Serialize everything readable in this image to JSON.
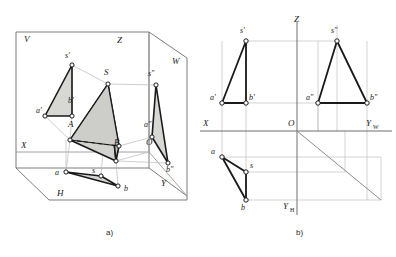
{
  "figure": {
    "captions": {
      "left": "a)",
      "right": "b)"
    },
    "colors": {
      "ink": "#1a1a1a",
      "thin_line": "#9a9a9a",
      "projection_line": "#b4b4b4",
      "face_fill": "#d6d6d2",
      "face_fill_dark": "#c7c7c2",
      "vertex_fill": "#ffffff",
      "background": "#ffffff"
    }
  },
  "panel_a": {
    "name": "pictorial-trihedral-view",
    "plane_labels": [
      {
        "id": "V",
        "text": "V",
        "x": 24,
        "y": 42
      },
      {
        "id": "Z",
        "text": "Z",
        "x": 117,
        "y": 43
      },
      {
        "id": "W",
        "text": "W",
        "x": 172,
        "y": 64
      },
      {
        "id": "X",
        "text": "X",
        "x": 21,
        "y": 148
      },
      {
        "id": "O",
        "text": "O",
        "x": 146,
        "y": 145
      },
      {
        "id": "Y",
        "text": "Y",
        "x": 161,
        "y": 186
      },
      {
        "id": "H",
        "text": "H",
        "x": 57,
        "y": 196
      }
    ],
    "point_labels": [
      {
        "id": "s-prime",
        "text": "s'",
        "x": 65,
        "y": 58
      },
      {
        "id": "S",
        "text": "S",
        "x": 104,
        "y": 75
      },
      {
        "id": "s-dblprime",
        "text": "s\"",
        "x": 148,
        "y": 76
      },
      {
        "id": "a-prime",
        "text": "a'",
        "x": 38,
        "y": 113
      },
      {
        "id": "b-prime",
        "text": "b'",
        "x": 71,
        "y": 103
      },
      {
        "id": "A",
        "text": "A",
        "x": 70,
        "y": 125
      },
      {
        "id": "B",
        "text": "B",
        "x": 116,
        "y": 143
      },
      {
        "id": "a-dblprime",
        "text": "a\"",
        "x": 146,
        "y": 127
      },
      {
        "id": "b-dblprime",
        "text": "b\"",
        "x": 169,
        "y": 158
      },
      {
        "id": "a",
        "text": "a",
        "x": 55,
        "y": 175
      },
      {
        "id": "s",
        "text": "s",
        "x": 92,
        "y": 173
      },
      {
        "id": "b",
        "text": "b",
        "x": 124,
        "y": 193
      }
    ],
    "vertices": [
      {
        "id": "s-prime",
        "x": 72,
        "y": 65
      },
      {
        "id": "S",
        "x": 108,
        "y": 84
      },
      {
        "id": "s-dblprime",
        "x": 156,
        "y": 85
      },
      {
        "id": "a-prime",
        "x": 45,
        "y": 116
      },
      {
        "id": "b-prime",
        "x": 72,
        "y": 116
      },
      {
        "id": "A",
        "x": 70,
        "y": 140
      },
      {
        "id": "B",
        "x": 119,
        "y": 146
      },
      {
        "id": "B-base",
        "x": 116,
        "y": 161
      },
      {
        "id": "a-dblprime",
        "x": 152,
        "y": 137
      },
      {
        "id": "b-dblprime",
        "x": 168,
        "y": 163
      },
      {
        "id": "a",
        "x": 66,
        "y": 172
      },
      {
        "id": "s",
        "x": 101,
        "y": 176
      },
      {
        "id": "b",
        "x": 118,
        "y": 186
      }
    ]
  },
  "panel_b": {
    "name": "epure-two-projection-drawing",
    "axis_labels": [
      {
        "id": "Z",
        "text": "Z",
        "x": 294,
        "y": 22
      },
      {
        "id": "X",
        "text": "X",
        "x": 206,
        "y": 122
      },
      {
        "id": "O",
        "text": "O",
        "x": 290,
        "y": 122
      },
      {
        "id": "Yw",
        "text": "Y",
        "sub": "W",
        "x": 368,
        "y": 122
      },
      {
        "id": "Yh",
        "text": "Y",
        "sub": "H",
        "x": 288,
        "y": 209
      }
    ],
    "point_labels": [
      {
        "id": "s-prime",
        "text": "s'",
        "x": 240,
        "y": 32
      },
      {
        "id": "s-dblprime",
        "text": "s\"",
        "x": 331,
        "y": 32
      },
      {
        "id": "a-prime",
        "text": "a'",
        "x": 212,
        "y": 98
      },
      {
        "id": "b-prime",
        "text": "b'",
        "x": 250,
        "y": 98
      },
      {
        "id": "a-dblprime",
        "text": "a\"",
        "x": 310,
        "y": 98
      },
      {
        "id": "b-dblprime",
        "text": "b\"",
        "x": 372,
        "y": 98
      },
      {
        "id": "a",
        "text": "a",
        "x": 212,
        "y": 152
      },
      {
        "id": "s",
        "text": "s",
        "x": 252,
        "y": 165
      },
      {
        "id": "b",
        "text": "b",
        "x": 240,
        "y": 208
      }
    ],
    "vertices": [
      {
        "id": "s-prime",
        "x": 246,
        "y": 41
      },
      {
        "id": "s-dblprime",
        "x": 337,
        "y": 41
      },
      {
        "id": "a-prime",
        "x": 222,
        "y": 103
      },
      {
        "id": "b-prime",
        "x": 246,
        "y": 103
      },
      {
        "id": "a-dblprime",
        "x": 318,
        "y": 103
      },
      {
        "id": "b-dblprime",
        "x": 367,
        "y": 103
      },
      {
        "id": "a",
        "x": 222,
        "y": 157
      },
      {
        "id": "s",
        "x": 246,
        "y": 172
      },
      {
        "id": "b",
        "x": 246,
        "y": 200
      }
    ],
    "axes": {
      "x_axis": {
        "y": 131,
        "x1": 200,
        "x2": 392
      },
      "z_axis": {
        "x": 297,
        "y1": 22,
        "y2": 131
      },
      "yh_axis": {
        "x": 297,
        "y1": 131,
        "y2": 215
      },
      "bisector": {
        "x1": 297,
        "y1": 131,
        "x2": 381,
        "y2": 200
      }
    }
  }
}
